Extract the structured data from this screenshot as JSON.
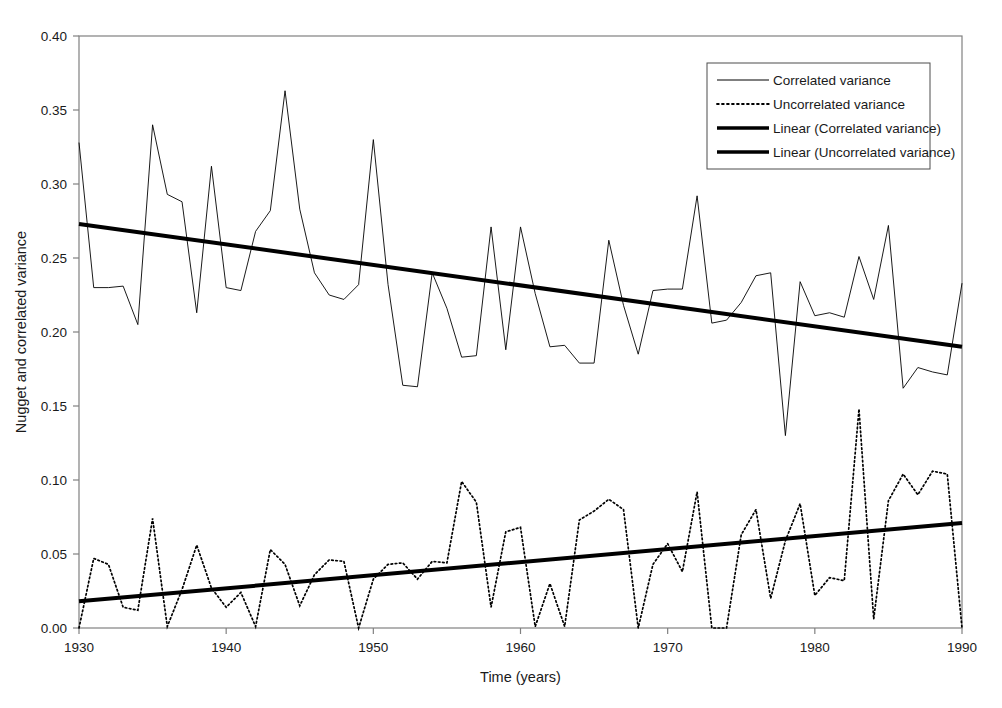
{
  "chart_data": {
    "type": "line",
    "title": "",
    "xlabel": "Time (years)",
    "ylabel": "Nugget and correlated variance",
    "xlim": [
      1930,
      1990
    ],
    "ylim": [
      0.0,
      0.4
    ],
    "grid": false,
    "legend_position": "top-right",
    "xticks": [
      1930,
      1940,
      1950,
      1960,
      1970,
      1980,
      1990
    ],
    "xtick_labels": [
      "1930",
      "1940",
      "1950",
      "1960",
      "1970",
      "1980",
      "1990"
    ],
    "yticks": [
      0.0,
      0.05,
      0.1,
      0.15,
      0.2,
      0.25,
      0.3,
      0.35,
      0.4
    ],
    "ytick_labels": [
      "0.00",
      "0.05",
      "0.10",
      "0.15",
      "0.20",
      "0.25",
      "0.30",
      "0.35",
      "0.40"
    ],
    "x": [
      1930,
      1931,
      1932,
      1933,
      1934,
      1935,
      1936,
      1937,
      1938,
      1939,
      1940,
      1941,
      1942,
      1943,
      1944,
      1945,
      1946,
      1947,
      1948,
      1949,
      1950,
      1951,
      1952,
      1953,
      1954,
      1955,
      1956,
      1957,
      1958,
      1959,
      1960,
      1961,
      1962,
      1963,
      1964,
      1965,
      1966,
      1967,
      1968,
      1969,
      1970,
      1971,
      1972,
      1973,
      1974,
      1975,
      1976,
      1977,
      1978,
      1979,
      1980,
      1981,
      1982,
      1983,
      1984,
      1985,
      1986,
      1987,
      1988,
      1989,
      1990
    ],
    "series": [
      {
        "name": "Correlated variance",
        "style": "thin-solid",
        "values": [
          0.328,
          0.23,
          0.23,
          0.231,
          0.205,
          0.34,
          0.293,
          0.288,
          0.213,
          0.312,
          0.23,
          0.228,
          0.268,
          0.282,
          0.363,
          0.283,
          0.24,
          0.225,
          0.222,
          0.232,
          0.33,
          0.232,
          0.164,
          0.163,
          0.24,
          0.216,
          0.183,
          0.184,
          0.271,
          0.188,
          0.271,
          0.226,
          0.19,
          0.191,
          0.179,
          0.179,
          0.262,
          0.218,
          0.185,
          0.228,
          0.229,
          0.229,
          0.292,
          0.206,
          0.208,
          0.22,
          0.238,
          0.24,
          0.13,
          0.234,
          0.211,
          0.213,
          0.21,
          0.251,
          0.222,
          0.272,
          0.162,
          0.176,
          0.173,
          0.171,
          0.233
        ]
      },
      {
        "name": "Uncorrelated variance",
        "style": "dotted",
        "values": [
          0.0,
          0.047,
          0.043,
          0.014,
          0.012,
          0.074,
          0.001,
          0.026,
          0.056,
          0.027,
          0.014,
          0.024,
          0.001,
          0.053,
          0.043,
          0.015,
          0.036,
          0.046,
          0.045,
          0.0,
          0.033,
          0.043,
          0.044,
          0.033,
          0.045,
          0.044,
          0.099,
          0.085,
          0.014,
          0.065,
          0.068,
          0.001,
          0.03,
          0.001,
          0.073,
          0.079,
          0.087,
          0.08,
          0.0,
          0.043,
          0.057,
          0.038,
          0.092,
          0.0,
          0.0,
          0.063,
          0.08,
          0.02,
          0.059,
          0.084,
          0.022,
          0.034,
          0.032,
          0.148,
          0.006,
          0.086,
          0.104,
          0.09,
          0.106,
          0.104,
          0.0
        ]
      }
    ],
    "trendlines": [
      {
        "name": "Linear (Correlated variance)",
        "style": "thick-solid",
        "x0": 1930,
        "y0": 0.273,
        "x1": 1990,
        "y1": 0.19
      },
      {
        "name": "Linear (Uncorrelated variance)",
        "style": "thick-solid",
        "x0": 1930,
        "y0": 0.018,
        "x1": 1990,
        "y1": 0.071
      }
    ],
    "legend_entries": [
      {
        "label": "Correlated variance",
        "style": "thin-solid"
      },
      {
        "label": "Uncorrelated variance",
        "style": "dotted"
      },
      {
        "label": "Linear (Correlated variance)",
        "style": "thick-solid"
      },
      {
        "label": "Linear (Uncorrelated variance)",
        "style": "thick-solid"
      }
    ],
    "colors": {
      "series": "#000000",
      "trend": "#000000",
      "axis": "#808080",
      "background": "#ffffff"
    }
  }
}
